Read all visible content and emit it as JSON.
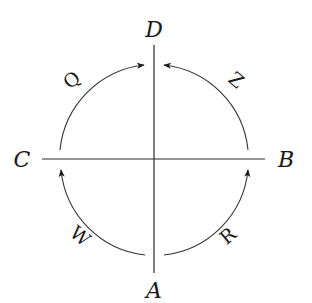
{
  "diagram": {
    "points": {
      "top": "D",
      "bottom": "A",
      "left": "C",
      "right": "B"
    },
    "arcs": {
      "upper_left": "Q",
      "upper_right": "Z",
      "lower_left": "W",
      "lower_right": "R"
    },
    "colors": {
      "line": "#2a2a2a",
      "text": "#1a1a1a",
      "background": "#ffffff"
    }
  }
}
